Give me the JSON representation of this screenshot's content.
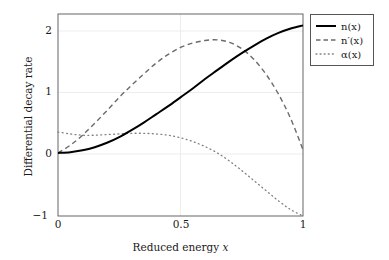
{
  "chart_data": {
    "type": "line",
    "title": "",
    "xlabel": "Reduced energy x",
    "ylabel": "Differential decay rate",
    "xlim": [
      0,
      1
    ],
    "ylim": [
      -1,
      2.2
    ],
    "xticks": [
      "0",
      "0.5",
      "1"
    ],
    "xtick_values": [
      0,
      0.5,
      1
    ],
    "yticks": [
      "-1",
      "0",
      "1",
      "2"
    ],
    "ytick_values": [
      -1,
      0,
      1,
      2
    ],
    "grid": "horizontal-and-vertical-at-ticks",
    "legend_position": "outside-top-right",
    "x": [
      0,
      0.05,
      0.1,
      0.15,
      0.2,
      0.25,
      0.3,
      0.35,
      0.4,
      0.45,
      0.5,
      0.55,
      0.6,
      0.65,
      0.7,
      0.75,
      0.8,
      0.85,
      0.9,
      0.95,
      1
    ],
    "series": [
      {
        "name": "n(x)",
        "style": "solid",
        "color": "#000000",
        "values": [
          0.0,
          0.01,
          0.04,
          0.09,
          0.16,
          0.25,
          0.36,
          0.48,
          0.61,
          0.74,
          0.88,
          1.02,
          1.17,
          1.31,
          1.45,
          1.58,
          1.7,
          1.81,
          1.9,
          1.97,
          2.02
        ]
      },
      {
        "name": "n'(x)",
        "style": "dashed",
        "color": "#666666",
        "values": [
          0.0,
          0.12,
          0.28,
          0.47,
          0.67,
          0.88,
          1.07,
          1.25,
          1.42,
          1.56,
          1.67,
          1.74,
          1.78,
          1.79,
          1.75,
          1.65,
          1.48,
          1.24,
          0.93,
          0.54,
          0.05
        ]
      },
      {
        "name": "α(x)",
        "style": "dotted",
        "color": "#808080",
        "values": [
          0.33,
          0.3,
          0.28,
          0.28,
          0.29,
          0.3,
          0.31,
          0.31,
          0.3,
          0.28,
          0.24,
          0.18,
          0.1,
          0.0,
          -0.13,
          -0.28,
          -0.44,
          -0.6,
          -0.76,
          -0.9,
          -1.0
        ]
      }
    ],
    "legend": [
      {
        "label": "n(x)",
        "style": "solid"
      },
      {
        "label": "n′(x)",
        "style": "dashed"
      },
      {
        "label": "α(x)",
        "style": "dotted"
      }
    ]
  },
  "axes": {
    "ylabel": "Differential decay rate",
    "xlabel_prefix": "Reduced energy ",
    "xlabel_var": "x",
    "ytick_0": "2",
    "ytick_1": "1",
    "ytick_2": "0",
    "ytick_3": "−1",
    "xtick_0": "0",
    "xtick_1": "0.5",
    "xtick_2": "1"
  },
  "legend": {
    "item_0": "n(x)",
    "item_1": "n′(x)",
    "item_2": "α(x)"
  },
  "colors": {
    "solid": "#000000",
    "dashed": "#666666",
    "dotted": "#808080",
    "axis": "#555555",
    "grid": "#e8e8e8"
  }
}
